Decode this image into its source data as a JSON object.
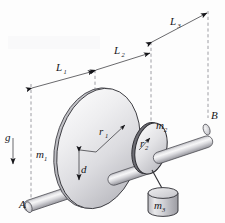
{
  "figure": {
    "background_color": "#fdfdfd",
    "ink_color": "#16161a",
    "dashed_color": "#7d7d85"
  },
  "labels": {
    "bearing_left": "A",
    "bearing_right": "B",
    "gravity": "g",
    "length_1": "L",
    "length_1_sub": "1",
    "length_2": "L",
    "length_2_sub": "2",
    "length_3": "L",
    "length_3_sub": "3",
    "radius_1": "r",
    "radius_1_sub": "1",
    "radius_2": "r",
    "radius_2_sub": "2",
    "mass_1": "m",
    "mass_1_sub": "1",
    "mass_2": "m",
    "mass_2_sub": "2",
    "mass_3": "m",
    "mass_3_sub": "3",
    "offset_d": "d"
  },
  "components": {
    "shaft": "horizontal inclined cylindrical shaft from A to B",
    "disk_large": "large disk mounted on shaft, mass m1, radius r1",
    "disk_small": "small disk mounted on shaft, mass m2, radius r2",
    "hanging_block": "cylindrical block m3 suspended by cord from small disk",
    "gravity_arrow": "downward vertical arrow labelled g",
    "dimension_lines": [
      "L1",
      "L2",
      "L3"
    ],
    "offset_dimension": "d"
  },
  "colors": {
    "disk_light": "#f2f2f3",
    "disk_mid": "#d3d3d6",
    "disk_dark": "#a9a9ae",
    "shaft_light": "#ededef",
    "shaft_mid": "#c9c9cd",
    "shaft_dark": "#9b9ba1",
    "rim_dark": "#3a3a40"
  }
}
